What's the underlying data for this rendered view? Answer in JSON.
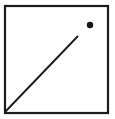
{
  "figure": {
    "canvas": {
      "width": 115,
      "height": 119,
      "background": "#ffffff"
    },
    "stroke_color": "#1c1c1c",
    "square": {
      "x": 5,
      "y": 6,
      "width": 103,
      "height": 107,
      "stroke_width": 2.2
    },
    "diagonal_line": {
      "x1": 5,
      "y1": 112,
      "x2": 78,
      "y2": 36,
      "stroke_width": 1.9
    },
    "dot": {
      "cx": 90,
      "cy": 25,
      "r": 3.2,
      "fill": "#161616"
    }
  }
}
